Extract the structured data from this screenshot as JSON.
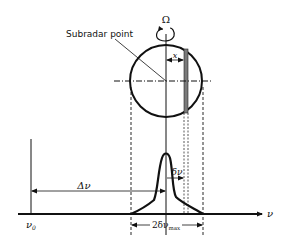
{
  "diagram": {
    "labels": {
      "subradar_point": "Subradar point",
      "rotation": "Ω",
      "x": "x",
      "delta_nu": "Δν",
      "small_delta_nu": "δν",
      "two_delta_nu_max_prefix": "2δν",
      "two_delta_nu_max_sub": "max",
      "nu0": "ν",
      "nu0_sub": "0",
      "nu_axis": "ν"
    },
    "colors": {
      "ink": "#111111",
      "strip": "#7a7a7a"
    }
  }
}
